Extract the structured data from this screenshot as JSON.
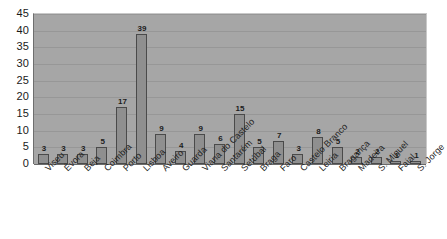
{
  "chart_data": {
    "type": "bar",
    "title": "",
    "subtitle": "",
    "xlabel": "",
    "ylabel": "",
    "ylim": [
      0,
      45
    ],
    "ytick_step": 5,
    "yticks": [
      45,
      40,
      35,
      30,
      25,
      20,
      15,
      10,
      5,
      0
    ],
    "grid": "horizontal",
    "legend": "none",
    "data_labels": true,
    "categories": [
      "Viseu",
      "Évora",
      "Beja",
      "Coimbra",
      "Porto",
      "Lisboa",
      "Aveiro",
      "Guarda",
      "Viana do Castelo",
      "Santarém",
      "Setúbal",
      "Braga",
      "Faro",
      "Castelo Branco",
      "Leiria",
      "Bragança",
      "Madeira",
      "S. Miguel",
      "Faial",
      "S. Jorge"
    ],
    "values": [
      3,
      3,
      3,
      5,
      17,
      39,
      9,
      4,
      9,
      6,
      15,
      5,
      7,
      3,
      8,
      5,
      2,
      2,
      1,
      1
    ],
    "colors": {
      "plot_background": "#a6a6a6",
      "bar_fill": "#8f8f8f",
      "bar_border": "#4a4a4a",
      "gridline": "#979797",
      "axis": "#6b6b6b",
      "text": "#1c1c1c",
      "page_background": "#ffffff"
    }
  }
}
